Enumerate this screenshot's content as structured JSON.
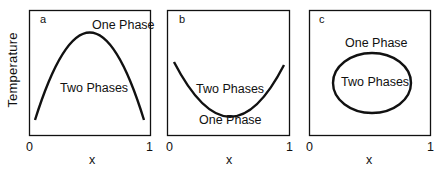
{
  "figure": {
    "ylabel": "Temperature",
    "panels": [
      {
        "id": "a",
        "label": "a",
        "upper_region": "One Phase",
        "lower_region": "Two Phases",
        "x_tick_min": "0",
        "x_tick_max": "1",
        "xlabel": "x",
        "curve": "concave-down dome (upper critical solution temperature)"
      },
      {
        "id": "b",
        "label": "b",
        "upper_region": "Two Phases",
        "lower_region": "One Phase",
        "x_tick_min": "0",
        "x_tick_max": "1",
        "xlabel": "x",
        "curve": "concave-up bowl (lower critical solution temperature)"
      },
      {
        "id": "c",
        "label": "c",
        "upper_region": "One Phase",
        "lower_region": "Two Phases",
        "x_tick_min": "0",
        "x_tick_max": "1",
        "xlabel": "x",
        "curve": "closed loop ellipse (upper and lower critical points)"
      }
    ]
  },
  "colors": {
    "line": "#111111",
    "background": "#ffffff"
  }
}
